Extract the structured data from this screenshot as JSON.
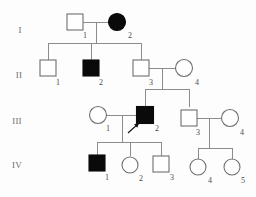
{
  "figure": {
    "kind": "pedigree-chart",
    "width": 256,
    "height": 197,
    "background_color": "#fdfdfd",
    "line_color": "#8c8c8c",
    "symbol_stroke_color": "#6f6f6f",
    "affected_fill_color": "#0a0a0a",
    "unaffected_fill_color": "#ffffff"
  },
  "generation_labels": [
    {
      "text": "I",
      "x": 20,
      "y": 33
    },
    {
      "text": "II",
      "x": 19,
      "y": 78
    },
    {
      "text": "III",
      "x": 17,
      "y": 124
    },
    {
      "text": "IV",
      "x": 17,
      "y": 168
    }
  ],
  "legend_semantics": {
    "square": "male",
    "circle": "female",
    "filled": "affected",
    "open": "unaffected",
    "arrow": "proband"
  },
  "individuals": [
    {
      "id": "I-1",
      "label": "1",
      "generation": "I",
      "sex": "male",
      "affected": false,
      "shape": "square",
      "cx": 75,
      "cy": 22,
      "size": 16,
      "label_x": 85,
      "label_y": 38
    },
    {
      "id": "I-2",
      "label": "2",
      "generation": "I",
      "sex": "female",
      "affected": true,
      "shape": "circle",
      "cx": 117,
      "cy": 22,
      "size": 17,
      "label_x": 130,
      "label_y": 38
    },
    {
      "id": "II-1",
      "label": "1",
      "generation": "II",
      "sex": "male",
      "affected": false,
      "shape": "square",
      "cx": 48,
      "cy": 68,
      "size": 16,
      "label_x": 58,
      "label_y": 85
    },
    {
      "id": "II-2",
      "label": "2",
      "generation": "II",
      "sex": "male",
      "affected": true,
      "shape": "square",
      "cx": 91,
      "cy": 68,
      "size": 16,
      "label_x": 101,
      "label_y": 85
    },
    {
      "id": "II-3",
      "label": "3",
      "generation": "II",
      "sex": "male",
      "affected": false,
      "shape": "square",
      "cx": 141,
      "cy": 68,
      "size": 16,
      "label_x": 151,
      "label_y": 85
    },
    {
      "id": "II-4",
      "label": "4",
      "generation": "II",
      "sex": "female",
      "affected": false,
      "shape": "circle",
      "cx": 184,
      "cy": 68,
      "size": 17,
      "label_x": 197,
      "label_y": 85
    },
    {
      "id": "III-1",
      "label": "1",
      "generation": "III",
      "sex": "female",
      "affected": false,
      "shape": "circle",
      "cx": 98,
      "cy": 115,
      "size": 17,
      "label_x": 108,
      "label_y": 131
    },
    {
      "id": "III-2",
      "label": "2",
      "generation": "III",
      "sex": "male",
      "affected": true,
      "shape": "square",
      "cx": 145,
      "cy": 115,
      "size": 17,
      "label_x": 157,
      "label_y": 131
    },
    {
      "id": "III-3",
      "label": "3",
      "generation": "III",
      "sex": "male",
      "affected": false,
      "shape": "square",
      "cx": 189,
      "cy": 118,
      "size": 16,
      "label_x": 198,
      "label_y": 135
    },
    {
      "id": "III-4",
      "label": "4",
      "generation": "III",
      "sex": "female",
      "affected": false,
      "shape": "circle",
      "cx": 230,
      "cy": 118,
      "size": 17,
      "label_x": 242,
      "label_y": 135
    },
    {
      "id": "IV-1",
      "label": "1",
      "generation": "IV",
      "sex": "male",
      "affected": true,
      "shape": "square",
      "cx": 97,
      "cy": 163,
      "size": 16,
      "label_x": 107,
      "label_y": 180
    },
    {
      "id": "IV-2",
      "label": "2",
      "generation": "IV",
      "sex": "female",
      "affected": false,
      "shape": "circle",
      "cx": 130,
      "cy": 165,
      "size": 16,
      "label_x": 141,
      "label_y": 181
    },
    {
      "id": "IV-3",
      "label": "3",
      "generation": "IV",
      "sex": "male",
      "affected": false,
      "shape": "square",
      "cx": 161,
      "cy": 164,
      "size": 16,
      "label_x": 172,
      "label_y": 180
    },
    {
      "id": "IV-4",
      "label": "4",
      "generation": "IV",
      "sex": "female",
      "affected": false,
      "shape": "circle",
      "cx": 198,
      "cy": 167,
      "size": 16,
      "label_x": 210,
      "label_y": 183
    },
    {
      "id": "IV-5",
      "label": "5",
      "generation": "IV",
      "sex": "female",
      "affected": false,
      "shape": "circle",
      "cx": 232,
      "cy": 167,
      "size": 16,
      "label_x": 243,
      "label_y": 183
    }
  ],
  "proband": {
    "target_id": "III-2",
    "arrow_tail_x": 128,
    "arrow_tail_y": 133,
    "arrow_tip_x": 139,
    "arrow_tip_y": 123
  },
  "connections": {
    "mating_lines": [
      {
        "name": "I-1 x I-2",
        "x1": 83,
        "x2": 109,
        "y": 22
      },
      {
        "name": "II-3 x II-4",
        "x1": 149,
        "x2": 176,
        "y": 68
      },
      {
        "name": "III-1 x III-2",
        "x1": 107,
        "x2": 137,
        "y": 115
      },
      {
        "name": "III-3 x III-4",
        "x1": 197,
        "x2": 222,
        "y": 118
      }
    ],
    "descent_lines": [
      {
        "name": "I couple descent",
        "x": 96,
        "y1": 22,
        "y2": 43
      },
      {
        "name": "II-3 couple descent",
        "x": 162,
        "y1": 68,
        "y2": 89
      },
      {
        "name": "III-1 couple descent",
        "x": 122,
        "y1": 115,
        "y2": 142
      },
      {
        "name": "III-3 couple descent",
        "x": 209,
        "y1": 118,
        "y2": 148
      }
    ],
    "sibship_bars": [
      {
        "name": "gen-II sibship",
        "y": 43,
        "x1": 48,
        "x2": 141,
        "children_x": [
          48,
          91,
          141
        ],
        "drop_to_y": 60
      },
      {
        "name": "gen-III sibship-left",
        "y": 89,
        "x1": 145,
        "x2": 189,
        "children_x": [
          145,
          189
        ],
        "drop_to_y": 107
      },
      {
        "name": "gen-IV sibship-left",
        "y": 142,
        "x1": 97,
        "x2": 161,
        "children_x": [
          97,
          130,
          161
        ],
        "drop_to_y": 156
      },
      {
        "name": "gen-IV sibship-right",
        "y": 148,
        "x1": 198,
        "x2": 232,
        "children_x": [
          198,
          232
        ],
        "drop_to_y": 159
      }
    ]
  }
}
